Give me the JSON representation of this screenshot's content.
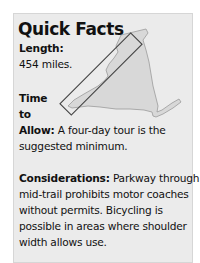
{
  "title": "Quick Facts",
  "length": {
    "label": "Length:",
    "value": "454 miles."
  },
  "time": {
    "label_line1": "Time",
    "label_line2": "to",
    "label_line3": "Allow:",
    "text_line1": " A four-day tour is the",
    "text_line2": "suggested minimum."
  },
  "considerations": {
    "label": "Considerations:",
    "lines": [
      " Parkway through",
      "mid-trail prohibits motor coaches",
      "without permits. Bicycling is",
      "possible in areas where shoulder",
      "width allows use."
    ]
  },
  "map": {
    "name": "state-outline-map",
    "fill": "#dcdcdc",
    "route_box_stroke": "#444444"
  }
}
